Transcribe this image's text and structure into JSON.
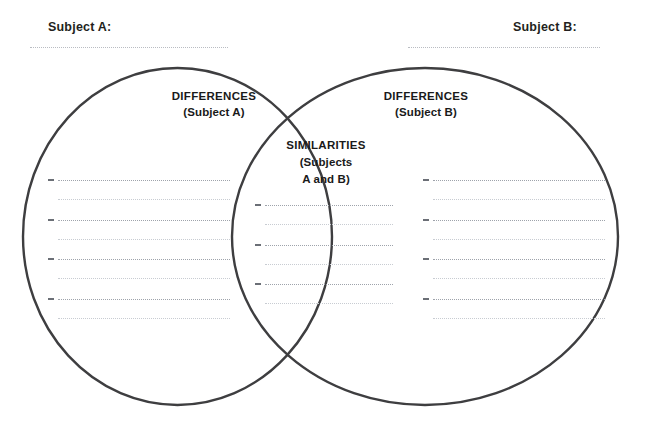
{
  "page": {
    "background_color": "#ffffff",
    "circle_stroke_color": "#3e3e40",
    "text_color": "#231f20",
    "rule_color": "#9ea3ab"
  },
  "header": {
    "subject_a_label": "Subject A:",
    "subject_b_label": "Subject B:"
  },
  "left_circle": {
    "title": "DIFFERENCES",
    "subtitle": "(Subject A)",
    "entry_count": 4
  },
  "right_circle": {
    "title": "DIFFERENCES",
    "subtitle": "(Subject B)",
    "entry_count": 4
  },
  "center_overlap": {
    "title": "SIMILARITIES",
    "subtitle_line1": "(Subjects",
    "subtitle_line2": "A and B)",
    "entry_count": 3
  },
  "writing_lines": {
    "left": [
      {
        "bullet": "–",
        "primary_width": 172,
        "secondary_width": 172
      },
      {
        "bullet": "–",
        "primary_width": 172,
        "secondary_width": 172
      },
      {
        "bullet": "–",
        "primary_width": 172,
        "secondary_width": 172
      },
      {
        "bullet": "–",
        "primary_width": 172,
        "secondary_width": 172
      }
    ],
    "center": [
      {
        "bullet": "–",
        "primary_width": 128,
        "secondary_width": 128
      },
      {
        "bullet": "–",
        "primary_width": 128,
        "secondary_width": 128
      },
      {
        "bullet": "–",
        "primary_width": 128,
        "secondary_width": 128
      }
    ],
    "right": [
      {
        "bullet": "–",
        "primary_width": 172,
        "secondary_width": 172
      },
      {
        "bullet": "–",
        "primary_width": 172,
        "secondary_width": 172
      },
      {
        "bullet": "–",
        "primary_width": 172,
        "secondary_width": 172
      },
      {
        "bullet": "–",
        "primary_width": 172,
        "secondary_width": 172
      }
    ]
  },
  "geometry": {
    "left_circle": {
      "cx": 177.5,
      "cy": 236.5,
      "rx": 154.5,
      "ry": 168.5
    },
    "right_circle": {
      "cx": 425.0,
      "cy": 236.5,
      "rx": 193.0,
      "ry": 168.5
    },
    "row_spacing": 39.5,
    "secondary_offset": 19
  }
}
